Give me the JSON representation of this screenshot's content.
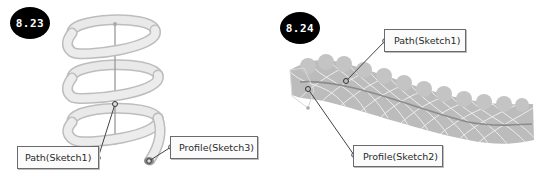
{
  "figures": [
    {
      "badge": "8.23",
      "callouts": {
        "path": "Path(Sketch1)",
        "profile": "Profile(Sketch3)"
      }
    },
    {
      "badge": "8.24",
      "callouts": {
        "path": "Path(Sketch1)",
        "profile": "Profile(Sketch2)"
      }
    }
  ],
  "colors": {
    "badge_bg": "#000000",
    "badge_text": "#ffffff",
    "spring_fill": "#e4e4e4",
    "spring_edge": "#b9b9b9",
    "sweep_fill": "#bdbdbd",
    "sweep_lines": "#e9e9e9",
    "leader": "#444444"
  }
}
